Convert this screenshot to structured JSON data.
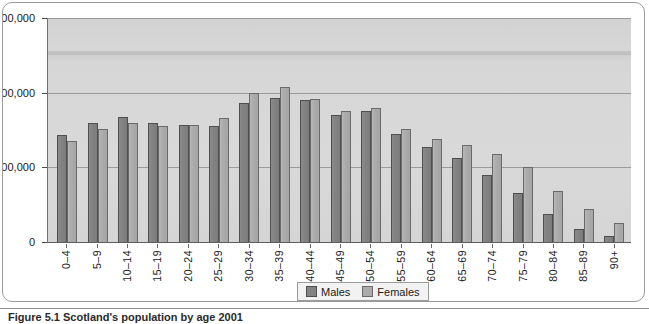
{
  "figure": {
    "caption": "Figure 5.1  Scotland's population by age 2001"
  },
  "legend": {
    "position": "bottom-center",
    "items": [
      {
        "label": "Males",
        "color": "#838383"
      },
      {
        "label": "Females",
        "color": "#ababab"
      }
    ]
  },
  "axis": {
    "y_ticks": [
      "0",
      "100,000",
      "200,000",
      "300,000"
    ],
    "y_tick_values": [
      0,
      100000,
      200000,
      300000
    ]
  },
  "chart_data": {
    "type": "bar",
    "title": "Scotland's population by age 2001",
    "xlabel": "",
    "ylabel": "",
    "ylim": [
      0,
      300000
    ],
    "grid": true,
    "legend_position": "bottom-center",
    "categories": [
      "0–4",
      "5–9",
      "10–14",
      "15–19",
      "20–24",
      "25–29",
      "30–34",
      "35–39",
      "40–44",
      "45–49",
      "50–54",
      "55–59",
      "60–64",
      "65–69",
      "70–74",
      "75–79",
      "80–84",
      "85–89",
      "90+"
    ],
    "series": [
      {
        "name": "Males",
        "color": "#838383",
        "values": [
          143000,
          159000,
          168000,
          160000,
          157000,
          155000,
          186000,
          193000,
          190000,
          170000,
          176000,
          145000,
          127000,
          113000,
          90000,
          66000,
          37000,
          18000,
          8000
        ]
      },
      {
        "name": "Females",
        "color": "#ababab",
        "values": [
          135000,
          152000,
          160000,
          156000,
          157000,
          166000,
          199000,
          208000,
          192000,
          175000,
          180000,
          151000,
          138000,
          130000,
          118000,
          100000,
          68000,
          44000,
          26000
        ]
      }
    ]
  }
}
